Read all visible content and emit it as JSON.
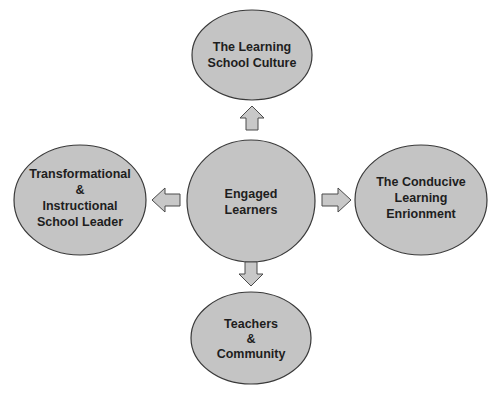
{
  "diagram": {
    "type": "hub-and-spoke",
    "colors": {
      "node_fill": "#c4c4c4",
      "node_stroke": "#3a3a3a",
      "arrow_fill": "#c8c8c8",
      "text": "#1e1e1e",
      "background": "#ffffff"
    },
    "center": {
      "id": "engaged-learners",
      "lines": [
        "Engaged",
        "Learners"
      ]
    },
    "nodes": {
      "top": {
        "id": "learning-school-culture",
        "lines": [
          "The Learning",
          "School Culture"
        ]
      },
      "left": {
        "id": "school-leader",
        "lines": [
          "Transformational",
          "&",
          "Instructional",
          "School Leader"
        ]
      },
      "right": {
        "id": "conducive-environment",
        "lines": [
          "The Conducive",
          "Learning",
          "Enrionment"
        ]
      },
      "bottom": {
        "id": "teachers-community",
        "lines": [
          "Teachers",
          "&",
          "Community"
        ]
      }
    },
    "edges": [
      {
        "from": "engaged-learners",
        "to": "learning-school-culture",
        "direction": "up"
      },
      {
        "from": "engaged-learners",
        "to": "school-leader",
        "direction": "left"
      },
      {
        "from": "engaged-learners",
        "to": "conducive-environment",
        "direction": "right"
      },
      {
        "from": "engaged-learners",
        "to": "teachers-community",
        "direction": "down"
      }
    ]
  }
}
